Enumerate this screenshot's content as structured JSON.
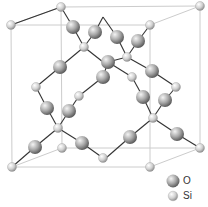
{
  "diagram": {
    "title": "",
    "cube": {
      "color": "#cccccc",
      "edges": [
        [
          11,
          25,
          150,
          25
        ],
        [
          150,
          25,
          150,
          167
        ],
        [
          150,
          167,
          12,
          167
        ],
        [
          12,
          167,
          11,
          25
        ],
        [
          61,
          7,
          200,
          6
        ],
        [
          200,
          6,
          200,
          148
        ],
        [
          200,
          148,
          62,
          148
        ],
        [
          62,
          148,
          61,
          7
        ],
        [
          11,
          25,
          61,
          7
        ],
        [
          150,
          25,
          200,
          6
        ],
        [
          150,
          167,
          200,
          148
        ],
        [
          12,
          167,
          62,
          148
        ]
      ]
    },
    "bond_color": "#333333",
    "bonds": [
      [
        11,
        25,
        61,
        7
      ],
      [
        61,
        7,
        73,
        27
      ],
      [
        73,
        27,
        84,
        47
      ],
      [
        84,
        47,
        95,
        32
      ],
      [
        95,
        32,
        103,
        17
      ],
      [
        84,
        47,
        103,
        62
      ],
      [
        84,
        47,
        60,
        67
      ],
      [
        60,
        67,
        36,
        87
      ],
      [
        36,
        87,
        47,
        108
      ],
      [
        47,
        108,
        58,
        128
      ],
      [
        58,
        128,
        69,
        111
      ],
      [
        69,
        111,
        79,
        96
      ],
      [
        79,
        96,
        103,
        77
      ],
      [
        103,
        77,
        108,
        62
      ],
      [
        58,
        128,
        35,
        147
      ],
      [
        35,
        147,
        12,
        167
      ],
      [
        58,
        128,
        82,
        143
      ],
      [
        82,
        143,
        103,
        158
      ],
      [
        150,
        25,
        138,
        41
      ],
      [
        138,
        41,
        127,
        57
      ],
      [
        127,
        57,
        117,
        37
      ],
      [
        117,
        37,
        103,
        17
      ],
      [
        127,
        57,
        152,
        71
      ],
      [
        152,
        71,
        176,
        87
      ],
      [
        176,
        87,
        165,
        100
      ],
      [
        165,
        100,
        153,
        118
      ],
      [
        127,
        57,
        108,
        62
      ],
      [
        132,
        77,
        143,
        97
      ],
      [
        143,
        97,
        153,
        118
      ],
      [
        132,
        77,
        108,
        62
      ],
      [
        153,
        118,
        130,
        137
      ],
      [
        130,
        137,
        106,
        158
      ],
      [
        153,
        118,
        177,
        134
      ],
      [
        177,
        134,
        200,
        148
      ]
    ],
    "atoms": [
      {
        "type": "Si",
        "x": 11,
        "y": 25
      },
      {
        "type": "Si",
        "x": 61,
        "y": 7
      },
      {
        "type": "Si",
        "x": 200,
        "y": 6
      },
      {
        "type": "Si",
        "x": 150,
        "y": 25
      },
      {
        "type": "O",
        "x": 73,
        "y": 27
      },
      {
        "type": "O",
        "x": 95,
        "y": 32
      },
      {
        "type": "Si",
        "x": 84,
        "y": 47
      },
      {
        "type": "O",
        "x": 117,
        "y": 37
      },
      {
        "type": "O",
        "x": 138,
        "y": 41
      },
      {
        "type": "Si",
        "x": 127,
        "y": 57
      },
      {
        "type": "O",
        "x": 108,
        "y": 62
      },
      {
        "type": "O",
        "x": 60,
        "y": 67
      },
      {
        "type": "O",
        "x": 152,
        "y": 71
      },
      {
        "type": "Si",
        "x": 132,
        "y": 77
      },
      {
        "type": "O",
        "x": 103,
        "y": 77
      },
      {
        "type": "Si",
        "x": 79,
        "y": 96
      },
      {
        "type": "Si",
        "x": 36,
        "y": 87
      },
      {
        "type": "Si",
        "x": 176,
        "y": 87
      },
      {
        "type": "O",
        "x": 143,
        "y": 97
      },
      {
        "type": "O",
        "x": 165,
        "y": 100
      },
      {
        "type": "O",
        "x": 47,
        "y": 108
      },
      {
        "type": "O",
        "x": 69,
        "y": 111
      },
      {
        "type": "Si",
        "x": 153,
        "y": 118
      },
      {
        "type": "Si",
        "x": 58,
        "y": 128
      },
      {
        "type": "O",
        "x": 130,
        "y": 137
      },
      {
        "type": "O",
        "x": 177,
        "y": 134
      },
      {
        "type": "O",
        "x": 35,
        "y": 147
      },
      {
        "type": "O",
        "x": 82,
        "y": 143
      },
      {
        "type": "Si",
        "x": 62,
        "y": 148
      },
      {
        "type": "Si",
        "x": 200,
        "y": 148
      },
      {
        "type": "Si",
        "x": 103,
        "y": 158
      },
      {
        "type": "Si",
        "x": 12,
        "y": 167
      },
      {
        "type": "Si",
        "x": 150,
        "y": 167
      }
    ],
    "atom_styles": {
      "O": {
        "radius": 7,
        "highlight": "#f2f2f2",
        "shade": "#6e6e6e"
      },
      "Si": {
        "radius": 4.5,
        "highlight": "#ffffff",
        "shade": "#9a9a9a"
      }
    }
  },
  "legend": {
    "items": [
      {
        "symbol": "O",
        "label": "O"
      },
      {
        "symbol": "Si",
        "label": "Si"
      }
    ]
  }
}
